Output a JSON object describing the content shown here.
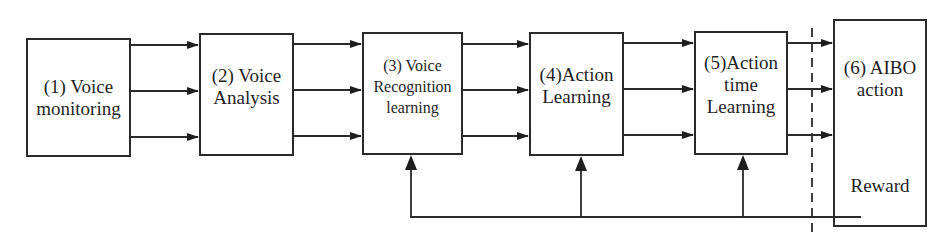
{
  "diagram": {
    "type": "flow-block-diagram",
    "blocks": [
      {
        "id": "1",
        "line1": "(1) Voice",
        "line2": "monitoring"
      },
      {
        "id": "2",
        "line1": "(2) Voice",
        "line2": "Analysis"
      },
      {
        "id": "3",
        "line1": "(3) Voice",
        "line2": "Recognition",
        "line3": "learning"
      },
      {
        "id": "4",
        "line1": "(4)Action",
        "line2": "Learning"
      },
      {
        "id": "5",
        "line1": "(5)Action",
        "line2": "time",
        "line3": "Learning"
      },
      {
        "id": "6",
        "line1": "(6) AIBO",
        "line2": "action",
        "line3": "Reward"
      }
    ],
    "connections": [
      {
        "from": "1",
        "to": "2",
        "count": 3
      },
      {
        "from": "2",
        "to": "3",
        "count": 3
      },
      {
        "from": "3",
        "to": "4",
        "count": 3
      },
      {
        "from": "4",
        "to": "5",
        "count": 3
      },
      {
        "from": "5",
        "to": "6",
        "count": 3
      },
      {
        "from": "6",
        "to": [
          "3",
          "4",
          "5"
        ],
        "label": "Reward feedback"
      }
    ],
    "colors": {
      "line": "#2a2a2a",
      "background": "#ffffff"
    }
  }
}
